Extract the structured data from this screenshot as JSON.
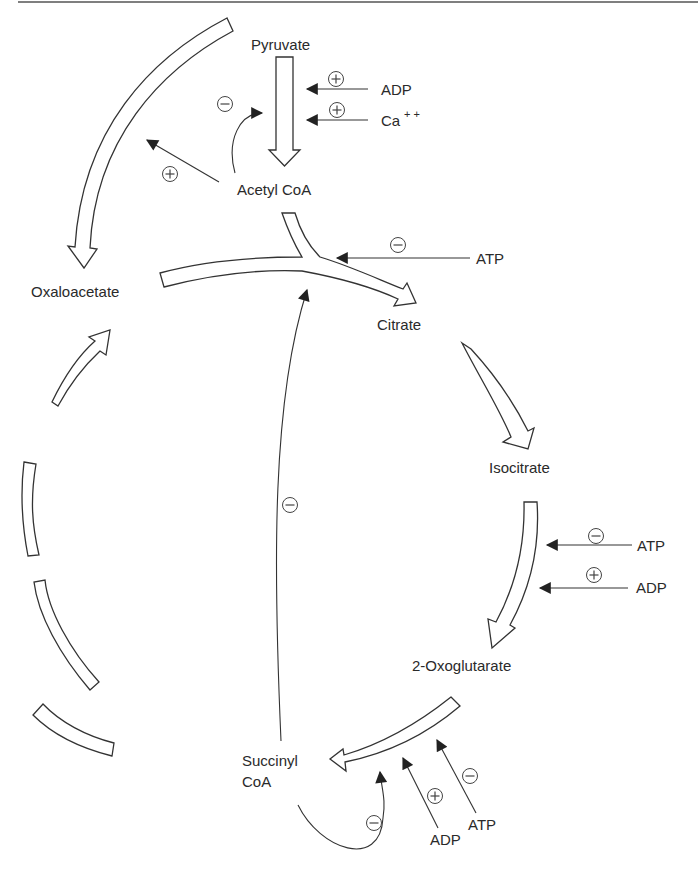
{
  "diagram": {
    "metabolites": {
      "pyruvate": "Pyruvate",
      "acetyl_coa": "Acetyl CoA",
      "oxaloacetate": "Oxaloacetate",
      "citrate": "Citrate",
      "isocitrate": "Isocitrate",
      "oxoglutarate": "2-Oxoglutarate",
      "succinyl_coa_line1": "Succinyl",
      "succinyl_coa_line2": "CoA"
    },
    "effectors": {
      "pdh_adp": "ADP",
      "pdh_ca": "Ca",
      "pdh_ca_sup": "+ +",
      "citrate_synthase_atp": "ATP",
      "idh_atp": "ATP",
      "idh_adp": "ADP",
      "ogdh_adp": "ADP",
      "ogdh_atp": "ATP"
    },
    "signs": {
      "positive": "+",
      "negative": "−"
    },
    "regulations": [
      {
        "target": "Pyruvate → Acetyl CoA",
        "effector": "ADP",
        "effect": "+"
      },
      {
        "target": "Pyruvate → Acetyl CoA",
        "effector": "Ca++",
        "effect": "+"
      },
      {
        "target": "Pyruvate → Acetyl CoA",
        "effector": "Acetyl CoA",
        "effect": "−"
      },
      {
        "target": "Pyruvate → Oxaloacetate",
        "effector": "Acetyl CoA",
        "effect": "+"
      },
      {
        "target": "Acetyl CoA + Oxaloacetate → Citrate",
        "effector": "ATP",
        "effect": "−"
      },
      {
        "target": "Acetyl CoA + Oxaloacetate → Citrate",
        "effector": "Succinyl CoA",
        "effect": "−"
      },
      {
        "target": "Isocitrate → 2-Oxoglutarate",
        "effector": "ATP",
        "effect": "−"
      },
      {
        "target": "Isocitrate → 2-Oxoglutarate",
        "effector": "ADP",
        "effect": "+"
      },
      {
        "target": "2-Oxoglutarate → Succinyl CoA",
        "effector": "Succinyl CoA",
        "effect": "−"
      },
      {
        "target": "2-Oxoglutarate → Succinyl CoA",
        "effector": "ADP",
        "effect": "+"
      },
      {
        "target": "2-Oxoglutarate → Succinyl CoA",
        "effector": "ATP",
        "effect": "−"
      }
    ]
  }
}
